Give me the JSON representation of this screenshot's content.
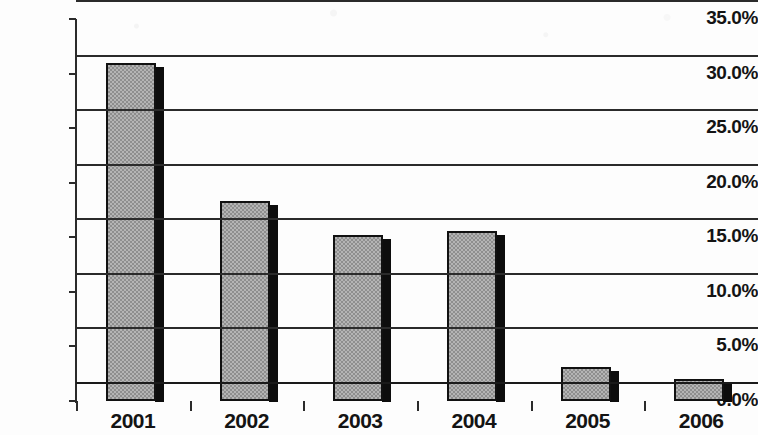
{
  "chart_data": {
    "type": "bar",
    "title": "",
    "subtitle": "",
    "xlabel": "",
    "ylabel": "",
    "categories": [
      "2001",
      "2002",
      "2003",
      "2004",
      "2005",
      "2006"
    ],
    "values": [
      31.0,
      18.3,
      15.2,
      15.6,
      3.1,
      2.0
    ],
    "ylim": [
      0.0,
      35.0
    ],
    "ytick_values": [
      0.0,
      5.0,
      10.0,
      15.0,
      20.0,
      25.0,
      30.0,
      35.0
    ],
    "ytick_labels": [
      "0.0%",
      "5.0%",
      "10.0%",
      "15.0%",
      "20.0%",
      "25.0%",
      "30.0%",
      "35.0%"
    ],
    "value_format": "percent",
    "grid": true,
    "grid_axis": "y",
    "legend": false,
    "legend_position": "none",
    "series": [
      {
        "name": "",
        "values": [
          31.0,
          18.3,
          15.2,
          15.6,
          3.1,
          2.0
        ]
      }
    ],
    "bar_fill_color": "#b4b4b4",
    "bar_border_color": "#111111",
    "bar_shadow_color": "#0d0d0d",
    "axis_color": "#2b2b2b",
    "text_color": "#141414",
    "background_color": "#ffffff"
  }
}
